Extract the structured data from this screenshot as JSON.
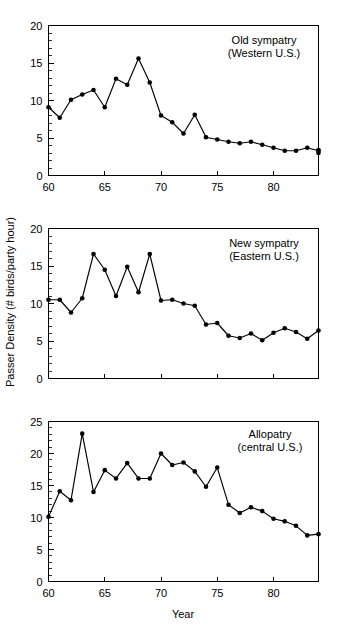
{
  "figure": {
    "ylabel": "Passer Density (# birds/party hour)",
    "xlabel": "Year"
  },
  "chart_data": [
    {
      "type": "line",
      "title": "Old sympatry",
      "subtitle": "(Western U.S.)",
      "annotation_line1": "Old sympatry",
      "annotation_line2": "(Western U.S.)",
      "xlabel": "",
      "ylabel": "",
      "xlim": [
        60,
        84
      ],
      "ylim": [
        0,
        20
      ],
      "xticks": [
        60,
        65,
        70,
        75,
        80
      ],
      "xtick_labels": [
        "60",
        "65",
        "70",
        "75",
        "80"
      ],
      "yticks": [
        0,
        5,
        10,
        15,
        20
      ],
      "ytick_labels": [
        "0",
        "5",
        "10",
        "15",
        "20"
      ],
      "yminor_step": 1,
      "grid": false,
      "legend": "none",
      "marker": "filled-circle",
      "x": [
        60,
        61,
        62,
        63,
        64,
        65,
        66,
        67,
        68,
        69,
        70,
        71,
        72,
        73,
        74,
        75,
        76,
        77,
        78,
        79,
        80,
        81,
        82,
        83,
        84
      ],
      "values": [
        9.1,
        7.7,
        10.1,
        10.8,
        11.4,
        9.1,
        12.9,
        12.1,
        15.6,
        12.4,
        8.0,
        7.1,
        5.6,
        8.1,
        5.1,
        4.8,
        4.5,
        4.3,
        4.5,
        4.1,
        3.7,
        3.3,
        3.3,
        3.7,
        3.3
      ],
      "extra_x": [
        85,
        86
      ],
      "extra_values": [
        3.0,
        3.4
      ]
    },
    {
      "type": "line",
      "title": "New sympatry",
      "subtitle": "(Eastern U.S.)",
      "annotation_line1": "New sympatry",
      "annotation_line2": "(Eastern U.S.)",
      "xlabel": "",
      "ylabel": "",
      "xlim": [
        60,
        84
      ],
      "ylim": [
        0,
        20
      ],
      "xticks": [
        60,
        65,
        70,
        75,
        80
      ],
      "xtick_labels": [
        "",
        "",
        "",
        "",
        ""
      ],
      "yticks": [
        0,
        5,
        10,
        15,
        20
      ],
      "ytick_labels": [
        "0",
        "5",
        "10",
        "15",
        "20"
      ],
      "yminor_step": 1,
      "grid": false,
      "legend": "none",
      "marker": "filled-circle",
      "x": [
        60,
        61,
        62,
        63,
        64,
        65,
        66,
        67,
        68,
        69,
        70,
        71,
        72,
        73,
        74,
        75,
        76,
        77,
        78,
        79,
        80,
        81,
        82,
        83,
        84
      ],
      "values": [
        10.5,
        10.5,
        8.8,
        10.7,
        16.6,
        14.5,
        11.0,
        14.9,
        11.5,
        16.6,
        10.4,
        10.5,
        10.0,
        9.7,
        7.2,
        7.4,
        5.7,
        5.4,
        6.0,
        5.1,
        6.1,
        6.7,
        6.2,
        5.3,
        6.4
      ]
    },
    {
      "type": "line",
      "title": "Allopatry",
      "subtitle": "(central U.S.)",
      "annotation_line1": "Allopatry",
      "annotation_line2": "(central U.S.)",
      "xlabel": "Year",
      "ylabel": "",
      "xlim": [
        60,
        84
      ],
      "ylim": [
        0,
        25
      ],
      "xticks": [
        60,
        65,
        70,
        75,
        80
      ],
      "xtick_labels": [
        "60",
        "65",
        "70",
        "75",
        "80"
      ],
      "yticks": [
        0,
        5,
        10,
        15,
        20,
        25
      ],
      "ytick_labels": [
        "0",
        "5",
        "10",
        "15",
        "20",
        "25"
      ],
      "yminor_step": 1,
      "grid": false,
      "legend": "none",
      "marker": "filled-circle",
      "x": [
        60,
        61,
        62,
        63,
        64,
        65,
        66,
        67,
        68,
        69,
        70,
        71,
        72,
        73,
        74,
        75,
        76,
        77,
        78,
        79,
        80,
        81,
        82,
        83,
        84
      ],
      "values": [
        10.1,
        14.1,
        12.7,
        23.1,
        14.0,
        17.4,
        16.1,
        18.5,
        16.1,
        16.1,
        20.0,
        18.2,
        18.6,
        17.2,
        14.8,
        17.8,
        12.0,
        10.7,
        11.6,
        11.0,
        9.8,
        9.4,
        8.7,
        7.2,
        7.4
      ]
    }
  ]
}
